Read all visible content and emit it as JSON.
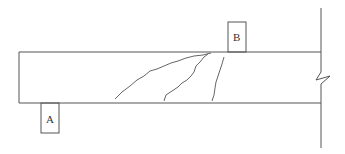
{
  "diagram": {
    "type": "structural beam with diagonal cracks",
    "colors": {
      "line": "#555555",
      "background": "#ffffff"
    },
    "beam": {
      "x1": 19,
      "x2": 321,
      "top": 52,
      "bottom": 103
    },
    "wall": {
      "x": 321,
      "top": 8,
      "bottom": 148,
      "break_symbol": "zigzag"
    },
    "supports": [
      {
        "id": "A",
        "label": "A",
        "position": "below beam",
        "x": 41,
        "y": 103,
        "w": 18,
        "h": 30
      },
      {
        "id": "B",
        "label": "B",
        "position": "above beam",
        "x": 228,
        "y": 22,
        "w": 18,
        "h": 30
      }
    ],
    "cracks_count": 3
  }
}
